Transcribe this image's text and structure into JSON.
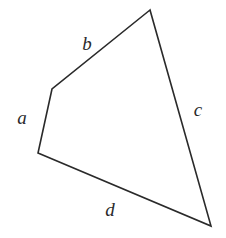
{
  "diagram": {
    "type": "quadrilateral",
    "stroke_color": "#2a2a2a",
    "background": "#ffffff",
    "vertices": {
      "top": [
        150,
        10
      ],
      "upper_left": [
        52,
        89
      ],
      "lower_left": [
        38,
        153
      ],
      "bottom_right": [
        211,
        226
      ]
    },
    "sides": [
      {
        "id": "a",
        "label": "a",
        "from": "upper_left",
        "to": "lower_left",
        "label_pos": [
          22,
          124
        ]
      },
      {
        "id": "b",
        "label": "b",
        "from": "upper_left",
        "to": "top",
        "label_pos": [
          87,
          50
        ]
      },
      {
        "id": "c",
        "label": "c",
        "from": "top",
        "to": "bottom_right",
        "label_pos": [
          197,
          116
        ]
      },
      {
        "id": "d",
        "label": "d",
        "from": "lower_left",
        "to": "bottom_right",
        "label_pos": [
          110,
          216
        ]
      }
    ]
  }
}
